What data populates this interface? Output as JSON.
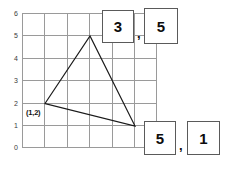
{
  "chart_data": {
    "type": "scatter",
    "title": "",
    "xlabel": "",
    "ylabel": "",
    "xlim": [
      0,
      6
    ],
    "ylim": [
      0,
      6
    ],
    "grid": true,
    "legend": null,
    "x_ticks": [
      0,
      1,
      2,
      3,
      4,
      5,
      6
    ],
    "y_ticks": [
      "6",
      "5",
      "4",
      "3",
      "2",
      "1",
      "0"
    ],
    "y_ticks_shown": true,
    "x_ticks_shown": false,
    "annotations": [
      {
        "text": "(1,2)",
        "x": 1,
        "y": 2
      }
    ],
    "shapes": [
      {
        "name": "triangle",
        "type": "polygon",
        "points": [
          [
            1,
            2
          ],
          [
            3,
            5
          ],
          [
            5,
            1
          ]
        ],
        "stroke": "#1a1a1a",
        "fill": "none"
      }
    ],
    "vertices": [
      {
        "label": "(1,2)",
        "x": 1,
        "y": 2
      },
      {
        "label": "(3,5)",
        "x": 3,
        "y": 5
      },
      {
        "label": "(5,1)",
        "x": 5,
        "y": 1
      }
    ]
  },
  "colors": {
    "grid_line": "#9a9a9a",
    "axis_line": "#8a8a8a",
    "triangle_stroke": "#1a1a1a",
    "box_border": "#5a5a5a",
    "text": "#0d0d0d",
    "tick_text": "#3a3a3a",
    "background": "#ffffff"
  },
  "axis": {
    "y_labels": [
      "6",
      "5",
      "4",
      "3",
      "2",
      "1",
      "0"
    ]
  },
  "annotation": {
    "point_label": "(1,2)"
  },
  "answers": {
    "top_pair": {
      "first_value": "3",
      "separator": ",",
      "second_value": "5"
    },
    "bottom_pair": {
      "first_value": "5",
      "separator": ",",
      "second_value": "1"
    }
  }
}
